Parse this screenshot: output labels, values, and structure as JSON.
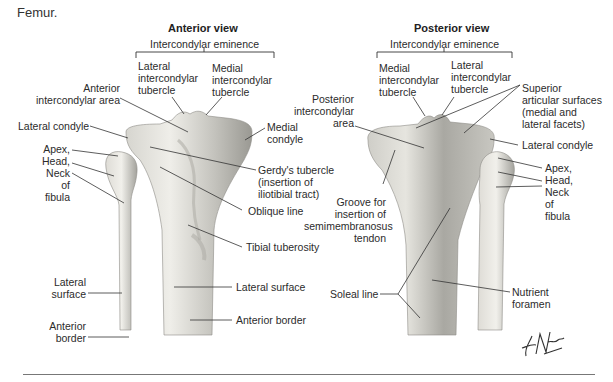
{
  "caption": "Femur.",
  "anterior": {
    "title": "Anterior view",
    "eminence": "Intercondylar eminence",
    "labels": {
      "lateral_tubercle": [
        "Lateral",
        "intercondylar",
        "tubercle"
      ],
      "medial_tubercle": [
        "Medial",
        "intercondylar",
        "tubercle"
      ],
      "anterior_area": [
        "Anterior",
        "intercondylar area"
      ],
      "lateral_condyle": "Lateral condyle",
      "medial_condyle": [
        "Medial",
        "condyle"
      ],
      "fibula_parts": [
        "Apex,",
        "Head,",
        "Neck",
        "of",
        "fibula"
      ],
      "gerdys": [
        "Gerdy's tubercle",
        "(insertion of",
        "iliotibial tract)"
      ],
      "oblique_line": "Oblique line",
      "tibial_tuberosity": "Tibial tuberosity",
      "lateral_surface_fib": [
        "Lateral",
        "surface"
      ],
      "anterior_border_fib": [
        "Anterior",
        "border"
      ],
      "lateral_surface_tib": "Lateral surface",
      "anterior_border_tib": "Anterior border"
    }
  },
  "posterior": {
    "title": "Posterior view",
    "eminence": "Intercondylar eminence",
    "labels": {
      "medial_tubercle": [
        "Medial",
        "intercondylar",
        "tubercle"
      ],
      "lateral_tubercle": [
        "Lateral",
        "intercondylar",
        "tubercle"
      ],
      "posterior_area": [
        "Posterior",
        "intercondylar",
        "area"
      ],
      "superior_surfaces": [
        "Superior",
        "articular surfaces",
        "(medial and",
        "lateral facets)"
      ],
      "lateral_condyle": "Lateral condyle",
      "fibula_parts": [
        "Apex,",
        "Head,",
        "Neck",
        "of",
        "fibula"
      ],
      "groove": [
        "Groove for",
        "insertion of",
        "semimembranosus",
        "tendon"
      ],
      "soleal_line": "Soleal line",
      "nutrient_foramen": [
        "Nutrient",
        "foramen"
      ]
    }
  },
  "signature": "F. Netter M.D.",
  "colors": {
    "bone_light": "#ecebe6",
    "bone_mid": "#c9c8c2",
    "bone_dark": "#8f8e88",
    "leader": "#333333"
  }
}
